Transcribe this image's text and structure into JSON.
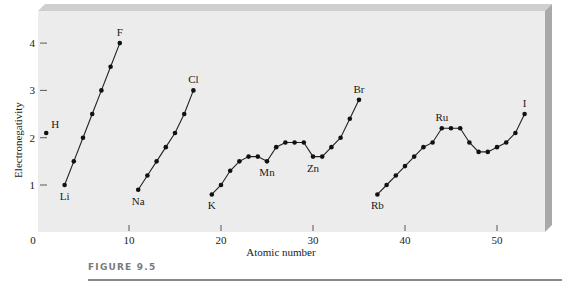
{
  "chart_data": {
    "type": "line",
    "title": "",
    "xlabel": "Atomic number",
    "ylabel": "Electronegativity",
    "xlim": [
      0,
      55
    ],
    "ylim": [
      0,
      4.4
    ],
    "xticks": [
      0,
      10,
      20,
      30,
      40,
      50
    ],
    "yticks": [
      1,
      2,
      3,
      4
    ],
    "grid": false,
    "legend": "none",
    "series": [
      {
        "name": "H",
        "x": [
          1
        ],
        "y": [
          2.1
        ],
        "labels": [
          {
            "text": "H",
            "z": 1,
            "pos": "above-right"
          }
        ]
      },
      {
        "name": "Period 2",
        "x": [
          3,
          4,
          5,
          6,
          7,
          8,
          9
        ],
        "y": [
          1.0,
          1.5,
          2.0,
          2.5,
          3.0,
          3.5,
          4.0
        ],
        "labels": [
          {
            "text": "Li",
            "z": 3,
            "pos": "below"
          },
          {
            "text": "F",
            "z": 9,
            "pos": "above"
          }
        ]
      },
      {
        "name": "Period 3",
        "x": [
          11,
          12,
          13,
          14,
          15,
          16,
          17
        ],
        "y": [
          0.9,
          1.2,
          1.5,
          1.8,
          2.1,
          2.5,
          3.0
        ],
        "labels": [
          {
            "text": "Na",
            "z": 11,
            "pos": "below"
          },
          {
            "text": "Cl",
            "z": 17,
            "pos": "above"
          }
        ]
      },
      {
        "name": "Period 4",
        "x": [
          19,
          20,
          21,
          22,
          23,
          24,
          25,
          26,
          27,
          28,
          29,
          30,
          31,
          32,
          33,
          34,
          35
        ],
        "y": [
          0.8,
          1.0,
          1.3,
          1.5,
          1.6,
          1.6,
          1.5,
          1.8,
          1.9,
          1.9,
          1.9,
          1.6,
          1.6,
          1.8,
          2.0,
          2.4,
          2.8
        ],
        "labels": [
          {
            "text": "K",
            "z": 19,
            "pos": "below"
          },
          {
            "text": "Mn",
            "z": 25,
            "pos": "below"
          },
          {
            "text": "Zn",
            "z": 30,
            "pos": "below"
          },
          {
            "text": "Br",
            "z": 35,
            "pos": "above"
          }
        ]
      },
      {
        "name": "Period 5",
        "x": [
          37,
          38,
          39,
          40,
          41,
          42,
          43,
          44,
          45,
          46,
          47,
          48,
          49,
          50,
          51,
          52,
          53
        ],
        "y": [
          0.8,
          1.0,
          1.2,
          1.4,
          1.6,
          1.8,
          1.9,
          2.2,
          2.2,
          2.2,
          1.9,
          1.7,
          1.7,
          1.8,
          1.9,
          2.1,
          2.5
        ],
        "labels": [
          {
            "text": "Rb",
            "z": 37,
            "pos": "below"
          },
          {
            "text": "Ru",
            "z": 44,
            "pos": "above"
          },
          {
            "text": "I",
            "z": 53,
            "pos": "above"
          }
        ]
      }
    ]
  },
  "caption": {
    "figure_label": "FIGURE 9.5"
  }
}
